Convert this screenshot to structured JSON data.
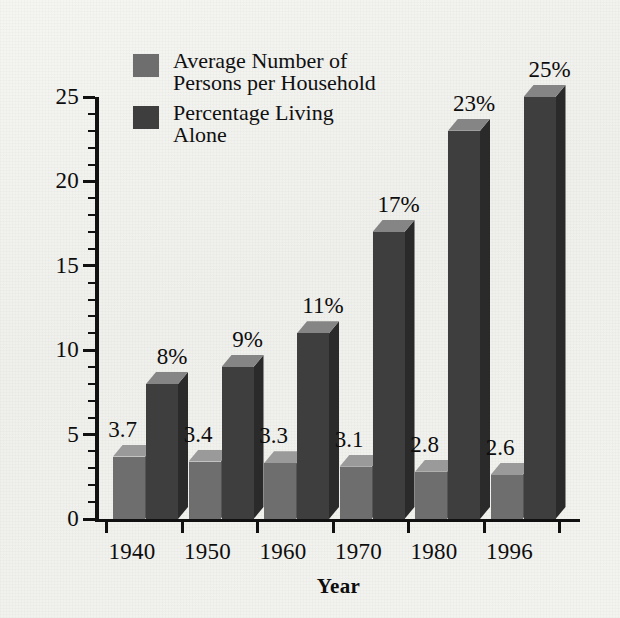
{
  "chart_data": {
    "type": "bar",
    "title": "",
    "subtitle": "",
    "xlabel": "Year",
    "ylabel": "",
    "categories": [
      "1940",
      "1950",
      "1960",
      "1970",
      "1980",
      "1996"
    ],
    "ylim": [
      0,
      25
    ],
    "y_ticks": [
      0,
      5,
      10,
      15,
      20,
      25
    ],
    "y_minor_tick_step": 1,
    "grid": false,
    "legend_position": "top-left",
    "style": "3d-column",
    "series": [
      {
        "name": "Average Number of\nPersons per Household",
        "short_name": "Average Number of Persons per Household",
        "color": "#6e6e6e",
        "top_color": "#9a9a9a",
        "side_color": "#555555",
        "value_suffix": "",
        "values": [
          3.7,
          3.4,
          3.3,
          3.1,
          2.8,
          2.6
        ],
        "labels": [
          "3.7",
          "3.4",
          "3.3",
          "3.1",
          "2.8",
          "2.6"
        ]
      },
      {
        "name": "Percentage Living\nAlone",
        "short_name": "Percentage Living Alone",
        "color": "#3e3e3e",
        "top_color": "#858585",
        "side_color": "#2a2a2a",
        "value_suffix": "%",
        "values": [
          8,
          9,
          11,
          17,
          23,
          25
        ],
        "labels": [
          "8%",
          "9%",
          "11%",
          "17%",
          "23%",
          "25%"
        ]
      }
    ]
  },
  "axis": {
    "y_tick_labels": [
      "25",
      "20",
      "15",
      "10",
      "5",
      "0"
    ],
    "x_tick_labels": [
      "1940",
      "1950",
      "1960",
      "1970",
      "1980",
      "1996"
    ],
    "x_title": "Year"
  },
  "legend": {
    "items": [
      {
        "label": "Average Number of\nPersons per Household",
        "color": "#6e6e6e"
      },
      {
        "label": "Percentage Living\nAlone",
        "color": "#3e3e3e"
      }
    ]
  },
  "colors": {
    "background": "#f2f2ef",
    "axis": "#111111",
    "text": "#0d0d0d",
    "series_light": "#6e6e6e",
    "series_dark": "#3e3e3e"
  }
}
